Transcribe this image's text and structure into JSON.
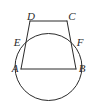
{
  "figure": {
    "background_color": "#ffffff",
    "stroke_color": "#2b2b2b",
    "stroke_width": 1,
    "canvas": {
      "width": 96,
      "height": 108
    },
    "labels": {
      "A": "A",
      "B": "B",
      "C": "C",
      "D": "D",
      "E": "E",
      "F": "F"
    },
    "label_positions": {
      "A": {
        "x": 15,
        "y": 69
      },
      "B": {
        "x": 82,
        "y": 69
      },
      "C": {
        "x": 72,
        "y": 17
      },
      "D": {
        "x": 31,
        "y": 17
      },
      "E": {
        "x": 17,
        "y": 43
      },
      "F": {
        "x": 80,
        "y": 43
      }
    },
    "vertices": {
      "A": {
        "x": 21,
        "y": 69
      },
      "B": {
        "x": 76,
        "y": 69
      },
      "C": {
        "x": 67,
        "y": 21
      },
      "D": {
        "x": 30,
        "y": 21
      },
      "E": {
        "x": 25,
        "y": 45
      },
      "F": {
        "x": 72,
        "y": 45
      }
    },
    "circle": {
      "cx": 48.5,
      "cy": 67,
      "r": 33.5,
      "top_y": 33.5,
      "bottom_y": 100.5,
      "left_x": 15,
      "right_x": 82
    },
    "segments": [
      {
        "name": "segment-DC",
        "from": "D",
        "to": "C"
      },
      {
        "name": "segment-DA",
        "from": "D",
        "to": "A"
      },
      {
        "name": "segment-CB",
        "from": "C",
        "to": "B"
      },
      {
        "name": "segment-AB",
        "from": "A",
        "to": "B"
      }
    ],
    "label_font_size": 11,
    "label_style": "italic-serif"
  }
}
